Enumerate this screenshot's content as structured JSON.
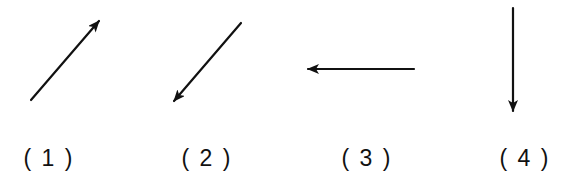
{
  "diagram": {
    "type": "vector-direction-figure",
    "stroke_color": "#111111",
    "background": "#ffffff",
    "panels": [
      {
        "label": "( 1 )",
        "label_x": 49,
        "direction": "up-right",
        "arrow": {
          "x1": 31,
          "y1": 100,
          "x2": 99,
          "y2": 21
        }
      },
      {
        "label": "( 2 )",
        "label_x": 207,
        "direction": "down-left",
        "arrow": {
          "x1": 241,
          "y1": 23,
          "x2": 174,
          "y2": 101
        }
      },
      {
        "label": "( 3 )",
        "label_x": 367,
        "direction": "left",
        "arrow": {
          "x1": 414,
          "y1": 69,
          "x2": 308,
          "y2": 69
        }
      },
      {
        "label": "( 4 )",
        "label_x": 525,
        "direction": "down",
        "arrow": {
          "x1": 513,
          "y1": 8,
          "x2": 513,
          "y2": 111
        }
      }
    ]
  }
}
